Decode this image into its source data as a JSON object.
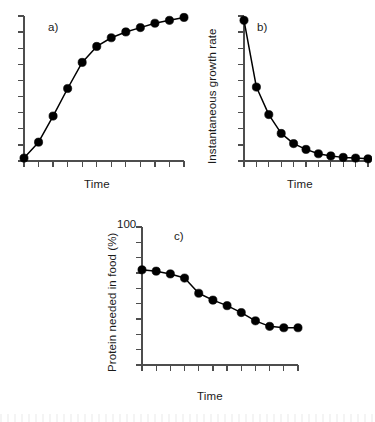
{
  "figure": {
    "background_color": "#ffffff",
    "ink_color": "#000000",
    "axis_color": "#4d4d4d",
    "marker_color": "#000000"
  },
  "panels": [
    {
      "letter": "a)",
      "xlabel": "Time",
      "ylabel": "",
      "ytick_label_top": ""
    },
    {
      "letter": "b)",
      "xlabel": "Time",
      "ylabel": "Instantaneous growth rate",
      "ytick_label_top": ""
    },
    {
      "letter": "c)",
      "xlabel": "Time",
      "ylabel": "Protein needed in food (%)",
      "ytick_label_top": "100"
    }
  ],
  "chart_data": [
    {
      "type": "line",
      "title": "a)",
      "xlabel": "Time",
      "ylabel": "",
      "xlim": [
        0,
        11
      ],
      "ylim": [
        0,
        100
      ],
      "grid": false,
      "legend": "none",
      "markers": "filled-circle",
      "x": [
        0,
        1,
        2,
        3,
        4,
        5,
        6,
        7,
        8,
        9,
        10,
        11
      ],
      "values": [
        2,
        13,
        31,
        50,
        68,
        79,
        85,
        89,
        92,
        95,
        97,
        99
      ],
      "n_xticks": 12,
      "n_yticks": 10
    },
    {
      "type": "line",
      "title": "b)",
      "xlabel": "Time",
      "ylabel": "Instantaneous growth rate",
      "xlim": [
        0,
        10
      ],
      "ylim": [
        0,
        100
      ],
      "grid": false,
      "legend": "none",
      "markers": "filled-circle",
      "x": [
        0,
        1,
        2,
        3,
        4,
        5,
        6,
        7,
        8,
        9,
        10
      ],
      "values": [
        97,
        51,
        32,
        19,
        12,
        8,
        5,
        3.5,
        2.5,
        2,
        1.5
      ],
      "n_xticks": 11,
      "n_yticks": 10
    },
    {
      "type": "line",
      "title": "c)",
      "xlabel": "Time",
      "ylabel": "Protein needed in food (%)",
      "xlim": [
        0,
        11
      ],
      "ylim": [
        0,
        100
      ],
      "grid": false,
      "legend": "none",
      "markers": "filled-circle",
      "ytick_labels": [
        {
          "value": 100,
          "text": "100"
        }
      ],
      "x": [
        0,
        1,
        2,
        3,
        4,
        5,
        6,
        7,
        8,
        9,
        10,
        11
      ],
      "values": [
        69,
        68,
        66,
        63,
        52,
        47,
        43,
        38,
        32,
        28,
        27,
        27
      ],
      "n_xticks": 12,
      "n_yticks": 10
    }
  ]
}
